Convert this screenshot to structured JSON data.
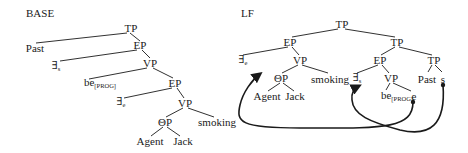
{
  "panels": {
    "base": {
      "title": "BASE",
      "nodes": {
        "tp": "TP",
        "past": "Past",
        "ep1": "EP",
        "exists_s": "∃",
        "exists_s_sub": "s",
        "vp1": "VP",
        "be": "be",
        "be_sub": "[PROG]",
        "ep2": "EP",
        "exists_e": "∃",
        "exists_e_sub": "e",
        "vp2": "VP",
        "theta_p": "ΘP",
        "smoking": "smoking",
        "agent": "Agent",
        "jack": "Jack"
      }
    },
    "lf": {
      "title": "LF",
      "nodes": {
        "tp_root": "TP",
        "ep_left": "EP",
        "tp_right": "TP",
        "exists_e": "∃",
        "exists_e_sub": "e",
        "vp_left": "VP",
        "ep_mid": "EP",
        "tp_low": "TP",
        "theta_p": "ΘP",
        "smoking": "smoking",
        "exists_s": "∃",
        "exists_s_sub": "s",
        "vp_mid": "VP",
        "past": "Past",
        "s": "s",
        "agent": "Agent",
        "jack": "Jack",
        "be": "be",
        "be_sub": "[PROG]",
        "e": "e"
      },
      "arrows": [
        {
          "from": "e",
          "to": "exists_e",
          "description": "e binds to ∃e"
        },
        {
          "from": "s",
          "to": "exists_s",
          "description": "s binds to ∃s"
        }
      ]
    }
  },
  "colors": {
    "ink": "#1a1a1a",
    "background": "#ffffff"
  }
}
